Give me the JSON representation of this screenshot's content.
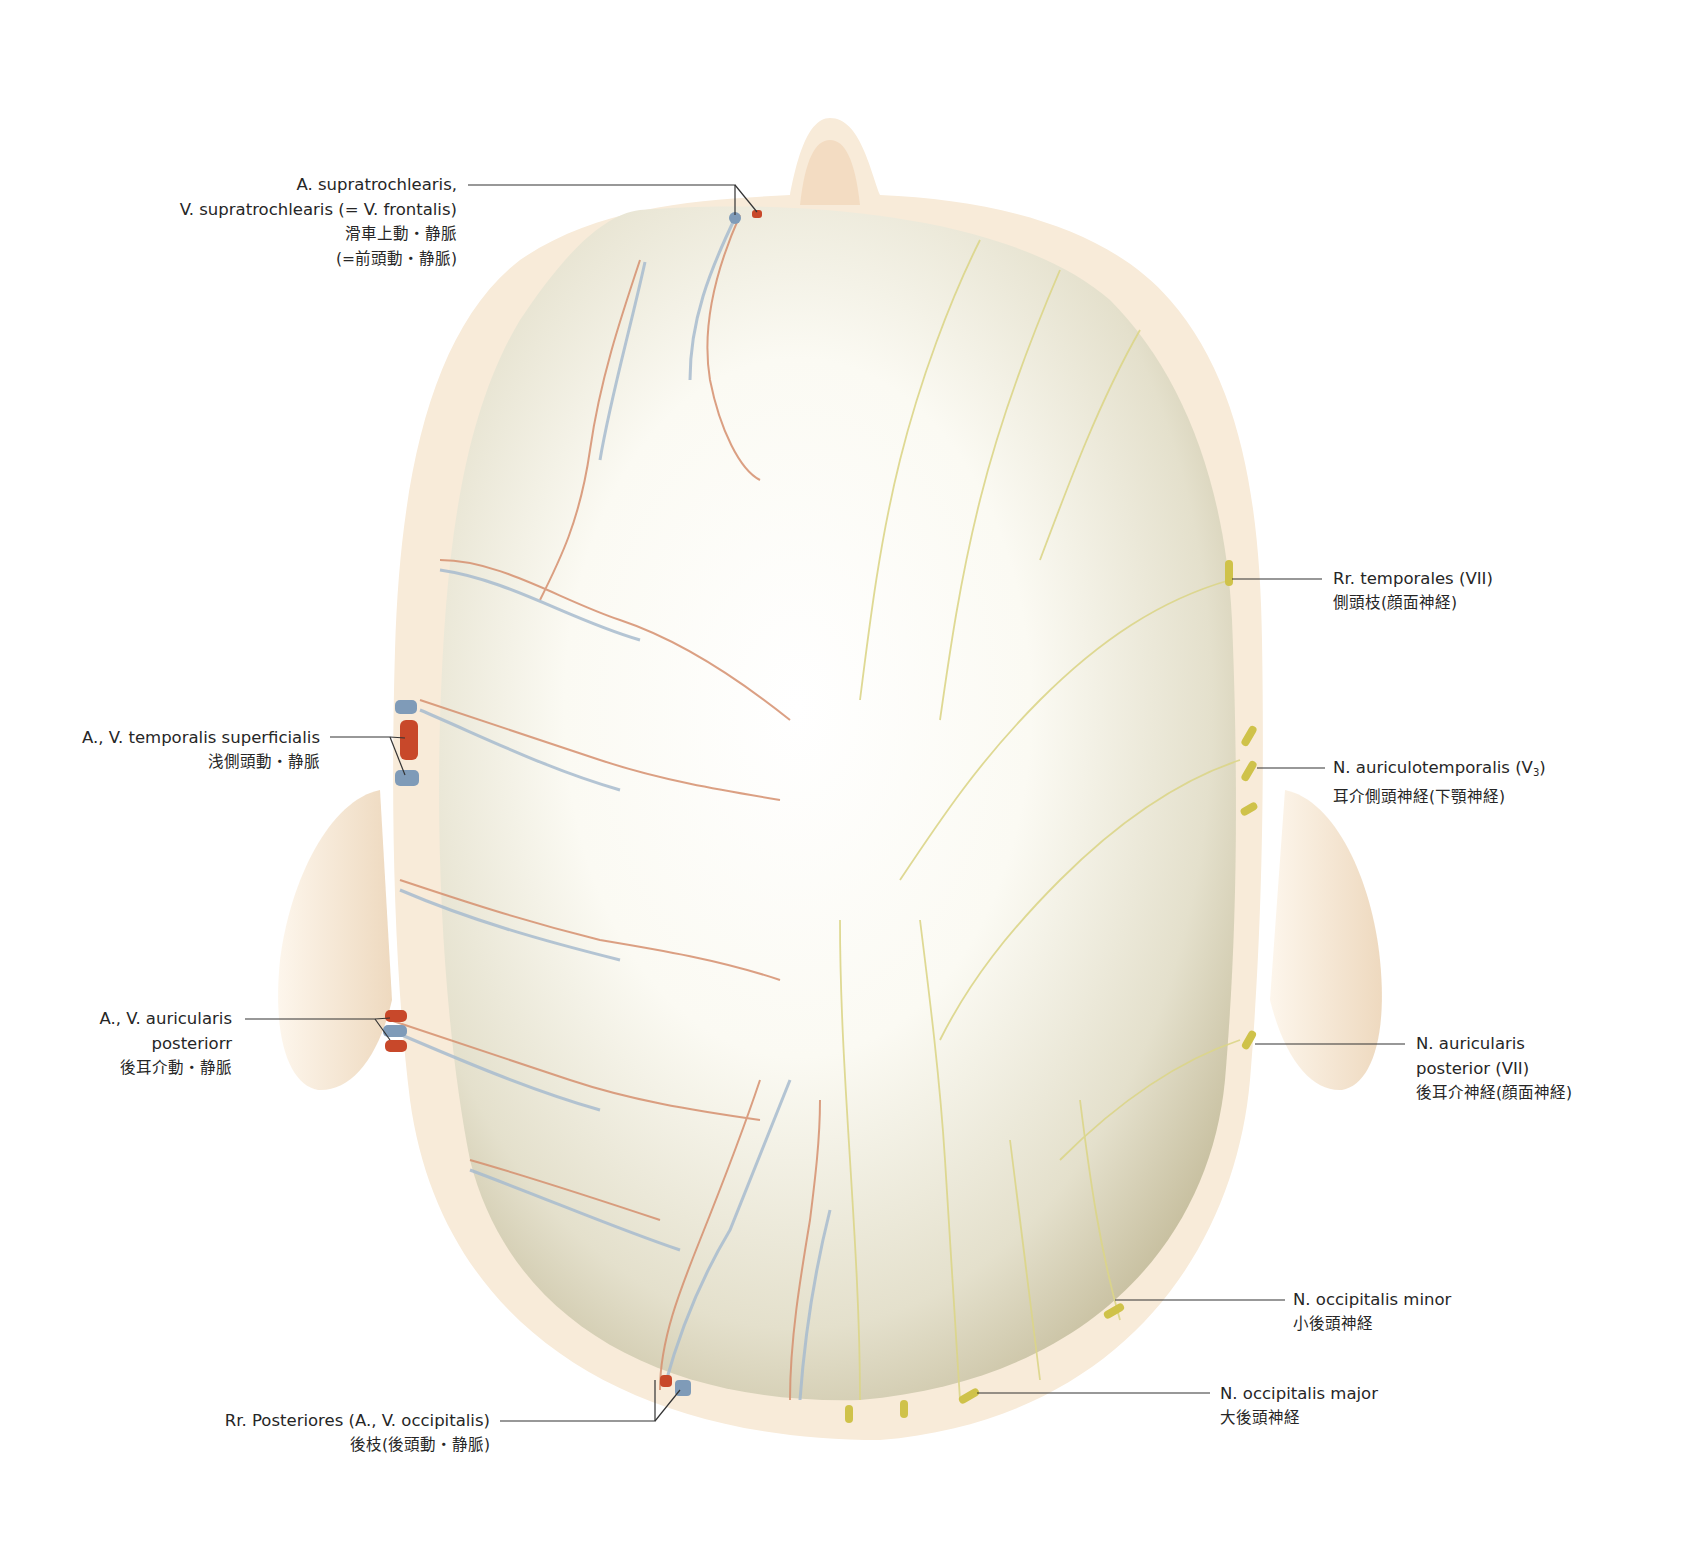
{
  "figure": {
    "view": "superior",
    "colors": {
      "background": "#ffffff",
      "scalp_outline": "#f7e9d6",
      "skull_light": "#fbfaf3",
      "skull_shadow": "#c9c2a6",
      "artery": "#c8482a",
      "vein": "#7f9bb8",
      "nerve": "#d9d37a",
      "leader_line": "#333333"
    }
  },
  "labels": {
    "supratrochlearis": {
      "line1": "A. supratrochlearis,",
      "line2": "V. supratrochlearis (= V. frontalis)",
      "jp1": "滑車上動・静脈",
      "jp2": "(=前頭動・静脈)"
    },
    "temporalis_superficialis": {
      "line1": "A., V. temporalis superficialis",
      "jp1": "浅側頭動・静脈"
    },
    "auricularis_posterior_vessels": {
      "line1": "A., V. auricularis",
      "line2": "posteriorr",
      "jp1": "後耳介動・静脈"
    },
    "rr_posteriores": {
      "line1": "Rr. Posteriores (A., V. occipitalis)",
      "jp1": "後枝(後頭動・静脈)"
    },
    "rr_temporales": {
      "line1": "Rr. temporales (VII)",
      "jp1": "側頭枝(顔面神経)"
    },
    "auriculotemporalis": {
      "line1": "N. auriculotemporalis (V",
      "sub": "3",
      "line1_end": ")",
      "jp1": "耳介側頭神経(下顎神経)"
    },
    "auricularis_posterior_nerve": {
      "line1": "N. auricularis",
      "line2": "posterior (VII)",
      "jp1": "後耳介神経(顔面神経)"
    },
    "occipitalis_minor": {
      "line1": "N. occipitalis minor",
      "jp1": "小後頭神経"
    },
    "occipitalis_major": {
      "line1": "N. occipitalis major",
      "jp1": "大後頭神経"
    }
  }
}
